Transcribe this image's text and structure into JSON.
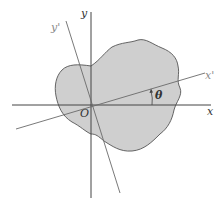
{
  "diagram": {
    "colors": {
      "region_fill": "#cfcfcf",
      "region_stroke": "#555555",
      "axis": "#444444",
      "rotated_axis": "#6a6a6a",
      "label": "#333333",
      "label_light": "#8a8a8a"
    },
    "labels": {
      "x_axis": "x",
      "y_axis": "y",
      "x_prime_axis": "x'",
      "y_prime_axis": "y'",
      "origin": "O",
      "angle": "θ"
    },
    "elements": [
      {
        "name": "x-axis",
        "type": "line",
        "description": "horizontal axis through origin"
      },
      {
        "name": "y-axis",
        "type": "line",
        "description": "vertical axis through origin"
      },
      {
        "name": "x-prime-axis",
        "type": "line",
        "description": "x-axis rotated counterclockwise by θ"
      },
      {
        "name": "y-prime-axis",
        "type": "line",
        "description": "y-axis rotated counterclockwise by θ"
      },
      {
        "name": "region",
        "type": "shape",
        "description": "irregular gray region containing origin"
      },
      {
        "name": "angle-arc",
        "type": "arrow",
        "description": "arc from x to x' indicating angle θ"
      }
    ]
  }
}
